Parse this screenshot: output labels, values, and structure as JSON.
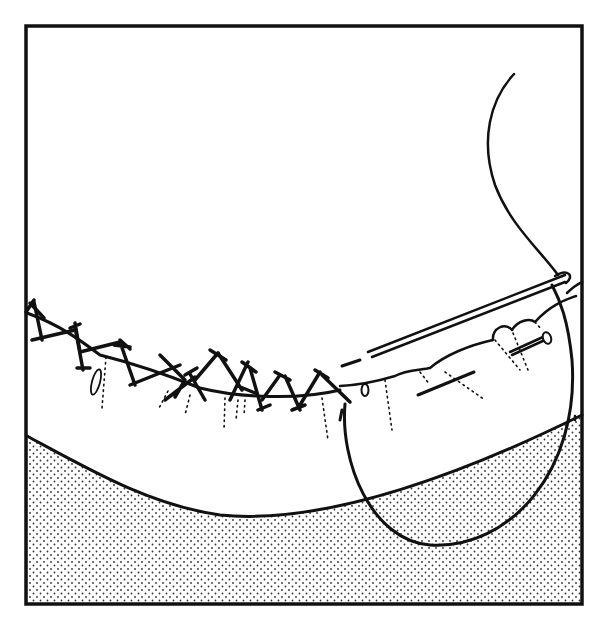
{
  "illustration": {
    "subject": "Hand-sewing a hem with cross (catch) stitch, needle and pin",
    "style": "black line art on white, stippled lower area",
    "colors": {
      "ink": "#111111",
      "paper": "#ffffff",
      "stipple": "#333333"
    },
    "frame": {
      "x": 25,
      "y": 25,
      "width": 558,
      "height": 580
    },
    "elements": [
      "frame",
      "fabric-fold-edge",
      "cross-stitch-row",
      "needle",
      "thread",
      "pin",
      "stippled-ground"
    ]
  }
}
